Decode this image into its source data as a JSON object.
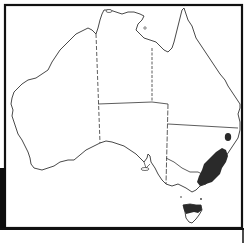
{
  "map": {
    "subject": "Australia distribution map",
    "regions": [
      "Western Australia",
      "Northern Territory",
      "Queensland",
      "South Australia",
      "New South Wales",
      "Victoria",
      "Tasmania"
    ],
    "distribution": {
      "description": "Shaded range along south-eastern Australia (eastern NSW and eastern Victoria) plus Tasmania, with a small isolated patch in northern NSW",
      "fill_color": "#2a2a2a"
    },
    "colors": {
      "background": "#ffffff",
      "outline": "#333333",
      "frame": "#111111"
    }
  }
}
